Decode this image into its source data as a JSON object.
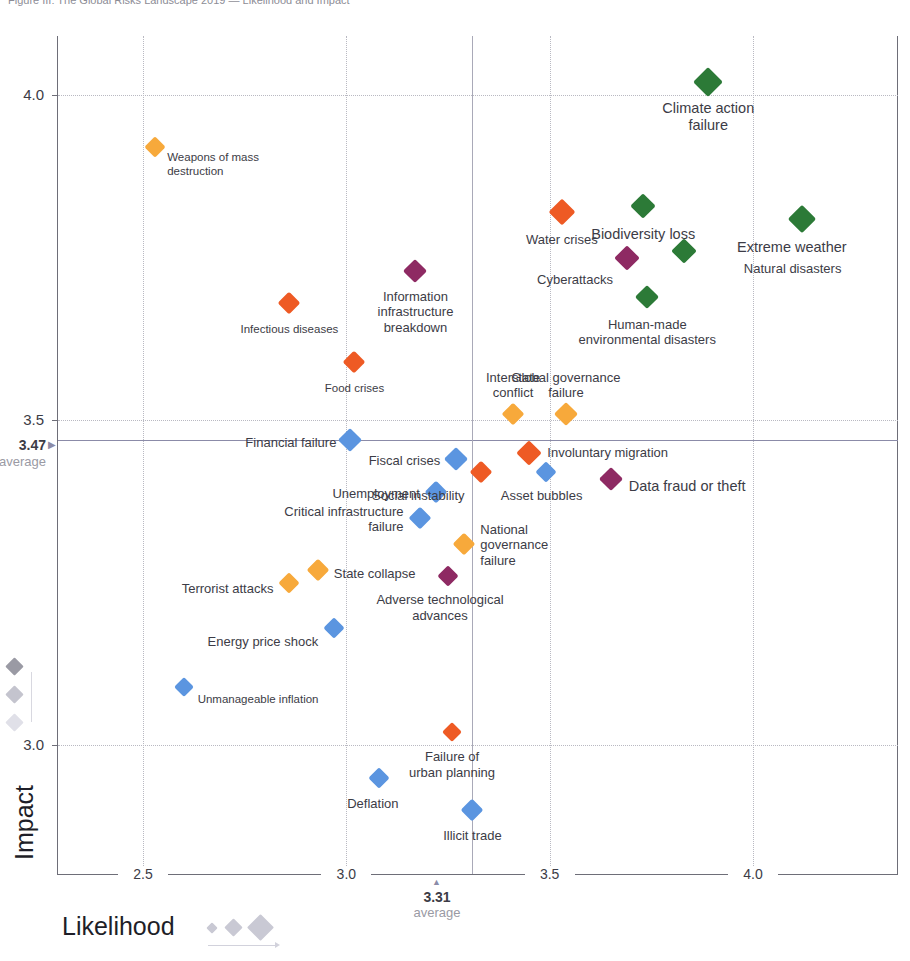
{
  "headline": "Figure III: The Global Risks Landscape 2019 — Likelihood and Impact",
  "axes": {
    "x_title": "Likelihood",
    "y_title": "Impact",
    "x_ticks": [
      "2.5",
      "3.0",
      "3.5",
      "4.0"
    ],
    "y_ticks": [
      "4.0",
      "3.5",
      "3.0"
    ],
    "x_average_value": "3.31",
    "x_average_label": "average",
    "y_average_value": "3.47",
    "y_average_label": "average",
    "y_avg_marker": "▶",
    "x_avg_marker": "▲"
  },
  "colors": {
    "economic": "#5b95e0",
    "environmental": "#2c7a37",
    "geopolitical": "#f7a93b",
    "societal": "#ee5a24",
    "technological": "#8e2a63",
    "grid": "#b9b9c2",
    "average_line": "#8b8ba8",
    "legend_grey": "#c9c9d4"
  },
  "chart_data": {
    "type": "scatter",
    "title": "The Global Risks Landscape 2019",
    "xlabel": "Likelihood",
    "ylabel": "Impact",
    "xlim": [
      2.35,
      4.18
    ],
    "ylim": [
      2.83,
      4.13
    ],
    "grid": true,
    "legend": "size legend bottom",
    "x_average": 3.31,
    "y_average": 3.47,
    "points": [
      {
        "name": "Weapons of mass\ndestruction",
        "x": 2.53,
        "y": 3.92,
        "category": "geopolitical",
        "size": 15
      },
      {
        "name": "Climate action\nfailure",
        "x": 3.89,
        "y": 4.02,
        "category": "environmental",
        "size": 21
      },
      {
        "name": "Extreme weather",
        "x": 4.12,
        "y": 3.81,
        "category": "environmental",
        "size": 20
      },
      {
        "name": "Biodiversity loss",
        "x": 3.73,
        "y": 3.83,
        "category": "environmental",
        "size": 18
      },
      {
        "name": "Water crises",
        "x": 3.53,
        "y": 3.82,
        "category": "societal",
        "size": 19
      },
      {
        "name": "Natural disasters",
        "x": 3.83,
        "y": 3.76,
        "category": "environmental",
        "size": 18
      },
      {
        "name": "Cyberattacks",
        "x": 3.69,
        "y": 3.75,
        "category": "technological",
        "size": 18
      },
      {
        "name": "Information\ninfrastructure\nbreakdown",
        "x": 3.17,
        "y": 3.73,
        "category": "technological",
        "size": 17
      },
      {
        "name": "Human-made\nenvironmental disasters",
        "x": 3.74,
        "y": 3.69,
        "category": "environmental",
        "size": 17
      },
      {
        "name": "Infectious diseases",
        "x": 2.86,
        "y": 3.68,
        "category": "societal",
        "size": 16
      },
      {
        "name": "Food crises",
        "x": 3.02,
        "y": 3.59,
        "category": "societal",
        "size": 16
      },
      {
        "name": "Global governance\nfailure",
        "x": 3.54,
        "y": 3.51,
        "category": "geopolitical",
        "size": 17
      },
      {
        "name": "Interstate\nconflict",
        "x": 3.41,
        "y": 3.51,
        "category": "geopolitical",
        "size": 16
      },
      {
        "name": "Financial failure",
        "x": 3.01,
        "y": 3.47,
        "category": "economic",
        "size": 17
      },
      {
        "name": "Fiscal crises",
        "x": 3.27,
        "y": 3.44,
        "category": "economic",
        "size": 17
      },
      {
        "name": "Involuntary migration",
        "x": 3.45,
        "y": 3.45,
        "category": "societal",
        "size": 18
      },
      {
        "name": "Social instability",
        "x": 3.33,
        "y": 3.42,
        "category": "societal",
        "size": 16
      },
      {
        "name": "Asset bubbles",
        "x": 3.49,
        "y": 3.42,
        "category": "economic",
        "size": 15
      },
      {
        "name": "Data fraud or theft",
        "x": 3.65,
        "y": 3.41,
        "category": "technological",
        "size": 17
      },
      {
        "name": "Unemployment",
        "x": 3.22,
        "y": 3.39,
        "category": "economic",
        "size": 16
      },
      {
        "name": "Critical infrastructure\nfailure",
        "x": 3.18,
        "y": 3.35,
        "category": "economic",
        "size": 16
      },
      {
        "name": "National\ngovernance\nfailure",
        "x": 3.29,
        "y": 3.31,
        "category": "geopolitical",
        "size": 16
      },
      {
        "name": "State collapse",
        "x": 2.93,
        "y": 3.27,
        "category": "geopolitical",
        "size": 16
      },
      {
        "name": "Adverse technological\nadvances",
        "x": 3.25,
        "y": 3.26,
        "category": "technological",
        "size": 15
      },
      {
        "name": "Terrorist attacks",
        "x": 2.86,
        "y": 3.25,
        "category": "geopolitical",
        "size": 15
      },
      {
        "name": "Energy price shock",
        "x": 2.97,
        "y": 3.18,
        "category": "economic",
        "size": 15
      },
      {
        "name": "Unmanageable inflation",
        "x": 2.6,
        "y": 3.09,
        "category": "economic",
        "size": 14
      },
      {
        "name": "Failure of\nurban planning",
        "x": 3.26,
        "y": 3.02,
        "category": "societal",
        "size": 14
      },
      {
        "name": "Deflation",
        "x": 3.08,
        "y": 2.95,
        "category": "economic",
        "size": 15
      },
      {
        "name": "Illicit trade",
        "x": 3.31,
        "y": 2.9,
        "category": "economic",
        "size": 16
      }
    ]
  },
  "size_legend": {
    "label": "Likelihood",
    "sizes": [
      8,
      13,
      19
    ]
  },
  "side_legend": {
    "sizes": [
      13,
      13,
      13
    ],
    "colors": [
      "#9a9aa4",
      "#c4c4ce",
      "#e0e0e8"
    ]
  }
}
